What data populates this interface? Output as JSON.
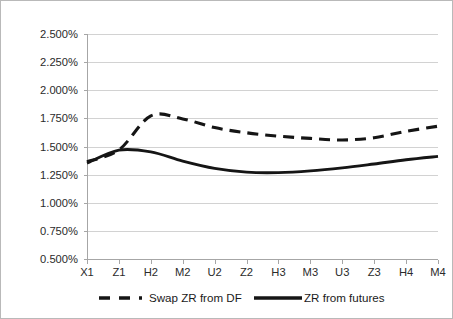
{
  "chart_data": {
    "type": "line",
    "title": "",
    "subtitle": "",
    "xlabel": "",
    "ylabel": "",
    "categories": [
      "X1",
      "Z1",
      "H2",
      "M2",
      "U2",
      "Z2",
      "H3",
      "M3",
      "U3",
      "Z3",
      "H4",
      "M4"
    ],
    "ylim": [
      0.5,
      2.5
    ],
    "ytick_values": [
      0.5,
      0.75,
      1.0,
      1.25,
      1.5,
      1.75,
      2.0,
      2.25,
      2.5
    ],
    "ytick_labels": [
      "0.500%",
      "0.750%",
      "1.000%",
      "1.250%",
      "1.500%",
      "1.750%",
      "2.000%",
      "2.250%",
      "2.500%"
    ],
    "grid": true,
    "grid_axis": "y",
    "legend_position": "bottom",
    "series": [
      {
        "name": "Swap ZR from DF",
        "style": "dashed",
        "color": "#151515",
        "values": [
          1.365,
          1.47,
          1.772,
          1.745,
          1.668,
          1.622,
          1.592,
          1.572,
          1.558,
          1.578,
          1.635,
          1.68
        ]
      },
      {
        "name": "ZR from futures",
        "style": "solid",
        "color": "#151515",
        "values": [
          1.352,
          1.468,
          1.452,
          1.37,
          1.305,
          1.272,
          1.268,
          1.283,
          1.31,
          1.345,
          1.382,
          1.412
        ]
      }
    ]
  },
  "legend": {
    "items": [
      {
        "label": "Swap ZR from DF",
        "style": "dashed"
      },
      {
        "label": "ZR from futures",
        "style": "solid"
      }
    ]
  },
  "colors": {
    "series_line": "#151515",
    "gridline": "#d2d2d2",
    "axis": "#a6a6a6",
    "frame_border": "#b9b9b9",
    "text": "#2b2b2b",
    "background": "#ffffff"
  }
}
